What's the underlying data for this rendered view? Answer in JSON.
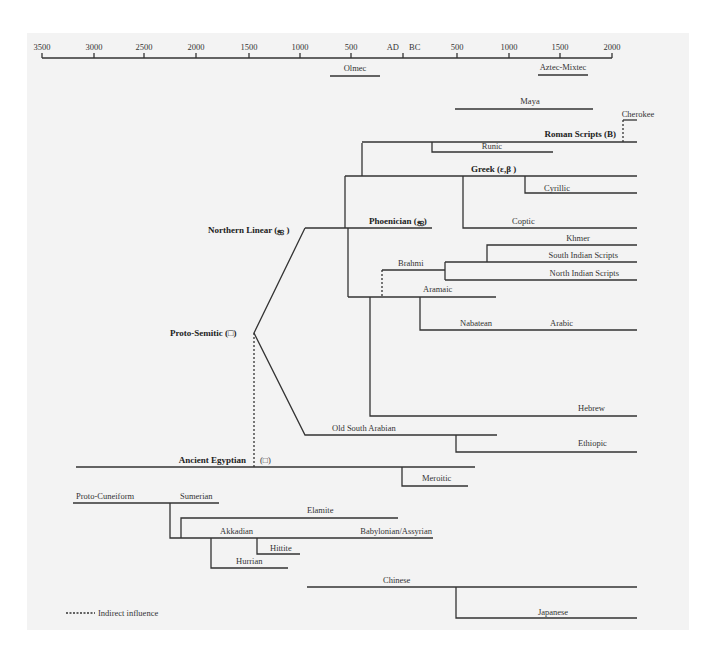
{
  "diagram": {
    "colors": {
      "background_panel": "#f3f3f3",
      "line": "#333333",
      "text": "#333333"
    },
    "timeline": {
      "ticks": [
        {
          "label": "3500",
          "x": 42
        },
        {
          "label": "3000",
          "x": 94
        },
        {
          "label": "2500",
          "x": 144
        },
        {
          "label": "2000",
          "x": 196
        },
        {
          "label": "1500",
          "x": 249
        },
        {
          "label": "1000",
          "x": 300
        },
        {
          "label": "500",
          "x": 351
        },
        {
          "label": "AD",
          "x": 403,
          "anchor": "end"
        },
        {
          "label": "BC",
          "x": 403,
          "anchor": "start"
        },
        {
          "label": "500",
          "x": 457
        },
        {
          "label": "1000",
          "x": 509
        },
        {
          "label": "1500",
          "x": 560
        },
        {
          "label": "2000",
          "x": 612
        }
      ]
    },
    "independent_scripts": [
      {
        "label": "Olmec"
      },
      {
        "label": "Aztec-Mixtec"
      },
      {
        "label": "Maya"
      }
    ],
    "nodes": {
      "cherokee": "Cherokee",
      "roman": "Roman Scripts (В)",
      "runic": "Runic",
      "greek": "Greek (ε,β )",
      "cyrillic": "Cyrillic",
      "phoenician": "Phoenician (ஐ)",
      "coptic": "Coptic",
      "northern_linear": "Northern Linear (ஐ )",
      "khmer": "Khmer",
      "south_indian": "South Indian Scripts",
      "brahmi": "Brahmi",
      "north_indian": "North Indian Scripts",
      "aramaic": "Aramaic",
      "proto_semitic": "Proto-Semitic (□)",
      "nabatean": "Nabatean",
      "arabic": "Arabic",
      "hebrew": "Hebrew",
      "old_south_arabian": "Old South Arabian",
      "ethiopic": "Ethiopic",
      "ancient_egyptian": "Ancient Egyptian",
      "egyptian_glyph": "(□)",
      "meroitic": "Meroitic",
      "proto_cuneiform": "Proto-Cuneiform",
      "sumerian": "Sumerian",
      "elamite": "Elamite",
      "akkadian": "Akkadian",
      "babylonian_assyrian": "Babylonian/Assyrian",
      "hittite": "Hittite",
      "hurrian": "Hurrian",
      "chinese": "Chinese",
      "japanese": "Japanese"
    },
    "legend": {
      "dashed_label": "Indirect influence"
    }
  }
}
